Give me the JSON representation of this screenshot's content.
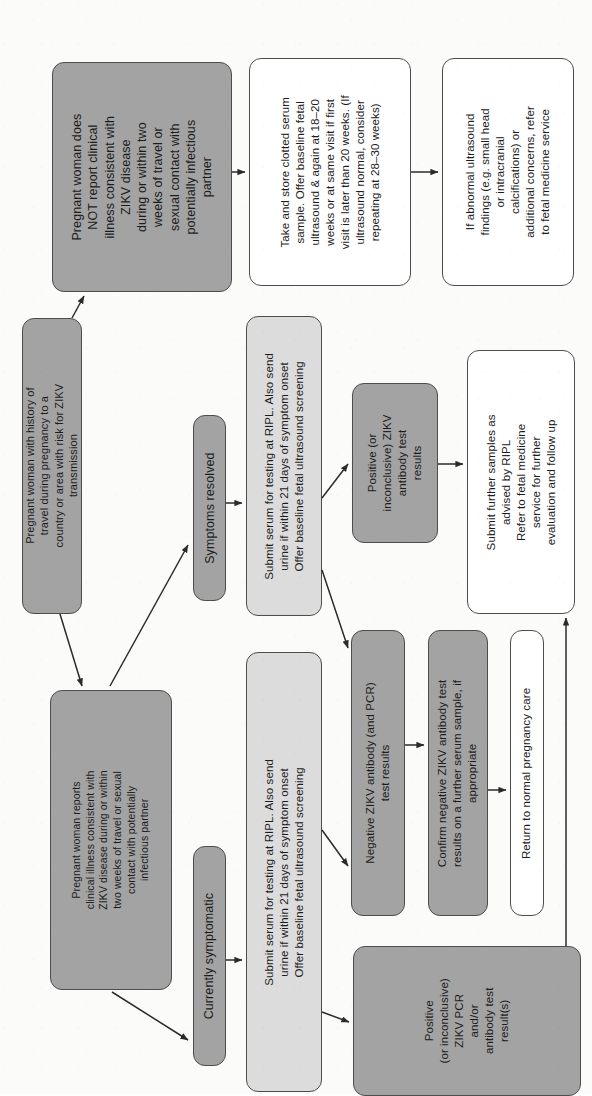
{
  "diagram": {
    "orientation": "text rotated 90 degrees counter-clockwise",
    "colors": {
      "fill_dark": "#a3a3a3",
      "fill_light": "#dcdcdc",
      "fill_white": "#ffffff",
      "stroke": "#4d4d4d",
      "arrow": "#2b2b2b",
      "text": "#1c1c1c",
      "page": "#fbfbfa"
    }
  },
  "nodes": {
    "travel_history": {
      "lines": [
        "Pregnant woman with history of",
        "travel during pregnancy to a",
        "country or area with risk for ZIKV",
        "transmission"
      ],
      "fill": "dark"
    },
    "no_clinical_illness": {
      "lines": [
        "Pregnant woman does",
        "NOT report clinical",
        "illness consistent with",
        "ZIKV disease",
        "during or within two",
        "weeks of travel or",
        "sexual contact with",
        "potentially infectious",
        "partner"
      ],
      "fill": "dark"
    },
    "reports_clinical_illness": {
      "lines": [
        "Pregnant woman reports",
        "clinical illness consistent with",
        "ZIKV disease during or within",
        "two weeks of travel or sexual",
        "contact with potentially",
        "infectious partner"
      ],
      "fill": "dark"
    },
    "take_store_serum": {
      "lines": [
        "Take and store clotted serum",
        "sample. Offer baseline fetal",
        "ultrasound & again at 18–20",
        "weeks or at same visit if first",
        "visit is later than 20 weeks. (If",
        "ultrasound normal, consider",
        "repeating at 28–30 weeks)"
      ],
      "fill": "white"
    },
    "abnormal_ultrasound": {
      "lines": [
        "If abnormal ultrasound",
        "findings (e.g. small head",
        "or intracranial",
        "calcifications) or",
        "additional concerns, refer",
        "to fetal medicine service"
      ],
      "fill": "white"
    },
    "symptoms_resolved": {
      "lines": [
        "Symptoms resolved"
      ],
      "fill": "dark"
    },
    "currently_symptomatic": {
      "lines": [
        "Currently symptomatic"
      ],
      "fill": "dark"
    },
    "submit_serum_resolved": {
      "lines": [
        "Submit serum for testing at RIPL. Also send",
        "urine if within 21 days of symptom onset",
        "Offer baseline fetal ultrasound screening"
      ],
      "fill": "light"
    },
    "submit_serum_symptomatic": {
      "lines": [
        "Submit serum for testing at RIPL. Also send",
        "urine if within 21 days of symptom onset",
        "Offer baseline fetal ultrasound screening"
      ],
      "fill": "light"
    },
    "positive_antibody": {
      "lines": [
        "Positive (or",
        "inconclusive) ZIKV",
        "antibody test",
        "results"
      ],
      "fill": "dark"
    },
    "negative_antibody": {
      "lines": [
        "Negative ZIKV antibody (and PCR)",
        "test results"
      ],
      "fill": "dark"
    },
    "positive_pcr": {
      "lines": [
        "Positive",
        "(or inconclusive)",
        "ZIKV PCR",
        "and/or",
        "antibody test",
        "result(s)"
      ],
      "fill": "dark"
    },
    "confirm_negative": {
      "lines": [
        "Confirm negative ZIKV antibody test",
        "results on a further serum sample, if",
        "appropriate"
      ],
      "fill": "dark"
    },
    "return_normal_care": {
      "lines": [
        "Return to normal pregnancy care"
      ],
      "fill": "white"
    },
    "submit_further_samples": {
      "lines": [
        "Submit further samples as",
        "advised by RIPL",
        "Refer to fetal medicine",
        "service for further",
        "evaluation and follow up"
      ],
      "fill": "white"
    }
  }
}
